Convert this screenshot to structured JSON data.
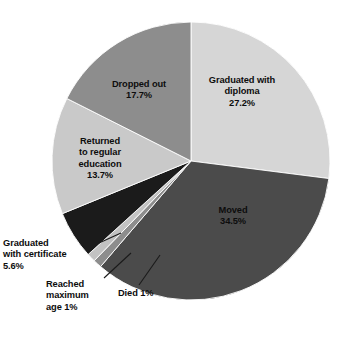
{
  "chart_data": {
    "type": "pie",
    "title": "",
    "subtitle": "",
    "xlabel": "",
    "ylabel": "",
    "legend": "none",
    "grid": false,
    "start_angle_deg": 0,
    "direction": "clockwise",
    "center": [
      191,
      161
    ],
    "radius": 139,
    "total_percent": 100.7,
    "categories": [
      "Graduated with diploma",
      "Moved",
      "Died",
      "Reached maximum age",
      "Graduated with certificate",
      "Returned to regular education",
      "Dropped out"
    ],
    "values": [
      27.2,
      34.5,
      1,
      1,
      5.6,
      13.7,
      17.7
    ],
    "slices": [
      {
        "name": "Graduated with diploma",
        "label_line1": "Graduated with",
        "label_line2": "diploma",
        "value_label": "27.2%",
        "value": 27.2,
        "color": "#d6d6d6",
        "label_placement": "inside"
      },
      {
        "name": "Moved",
        "label_line1": "Moved",
        "label_line2": "",
        "value_label": "34.5%",
        "value": 34.5,
        "color": "#4b4b4b",
        "label_placement": "inside"
      },
      {
        "name": "Died",
        "label_line1": "Died 1%",
        "label_line2": "",
        "value_label": "1%",
        "value": 1,
        "color": "#8d8d8d",
        "label_placement": "outside"
      },
      {
        "name": "Reached maximum age",
        "label_line1": "Reached",
        "label_line2": "maximum",
        "label_line3": "age 1%",
        "value_label": "1%",
        "value": 1,
        "color": "#c2c2c2",
        "label_placement": "outside"
      },
      {
        "name": "Graduated with certificate",
        "label_line1": "Graduated",
        "label_line2": "with certificate",
        "value_label": "5.6%",
        "value": 5.6,
        "color": "#1b1b1b",
        "label_placement": "outside"
      },
      {
        "name": "Returned to regular education",
        "label_line1": "Returned",
        "label_line2": "to regular",
        "label_line3": "education",
        "value_label": "13.7%",
        "value": 13.7,
        "color": "#c9c9c9",
        "label_placement": "inside"
      },
      {
        "name": "Dropped out",
        "label_line1": "Dropped out",
        "label_line2": "",
        "value_label": "17.7%",
        "value": 17.7,
        "color": "#8d8d8d",
        "label_placement": "inside"
      }
    ],
    "labels_text": {
      "diploma": "Graduated with\ndiploma\n27.2%",
      "moved": "Moved\n34.5%",
      "dropped_out": "Dropped out\n17.7%",
      "returned": "Returned\nto regular\neducation\n13.7%",
      "certificate": "Graduated\nwith certificate\n5.6%",
      "reached_max_age": "Reached\nmaximum\nage 1%",
      "died": "Died 1%"
    },
    "colors": {
      "background": "#ffffff",
      "text": "#0d0d0d",
      "leader_line": "#1a1a1a",
      "slice_divider": "#ffffff"
    }
  }
}
